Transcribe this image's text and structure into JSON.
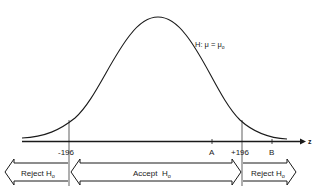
{
  "diagram": {
    "hypothesis_label": "H: μ = μ₀",
    "hypothesis_main": "H: μ = μ",
    "hypothesis_sub": "o",
    "axis_label": "z",
    "ticks": {
      "left_critical": "-196",
      "right_critical": "+196",
      "point_a": "A",
      "point_b": "B"
    },
    "regions": {
      "left_reject": {
        "main": "Reject H",
        "sub": "o"
      },
      "accept": {
        "main": "Accept  H",
        "sub": "o"
      },
      "right_reject": {
        "main": "Reject H",
        "sub": "o"
      }
    },
    "colors": {
      "ink": "#1a1a1a",
      "background": "#ffffff"
    }
  }
}
